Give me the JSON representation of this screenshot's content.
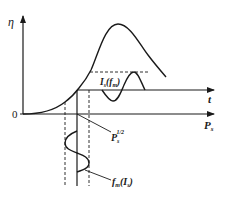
{
  "diagram": {
    "axes": {
      "y_label": "η",
      "x_label": "P",
      "x_label_sub": "s",
      "t_label": "t",
      "origin_label": "0"
    },
    "annotations": {
      "output_signal": {
        "main": "I",
        "sub": "s",
        "paren_open": "(",
        "func": "f",
        "func_sub": "m",
        "paren_close": ")"
      },
      "pump_power": {
        "main": "P",
        "sub": "s",
        "sup": "1/2"
      },
      "modulation": {
        "func": "f",
        "func_sub": "m",
        "paren_open": "(",
        "main": "I",
        "sub": "s",
        "paren_close": ")"
      }
    },
    "colors": {
      "stroke": "#1a1a1a",
      "background": "#ffffff"
    }
  }
}
